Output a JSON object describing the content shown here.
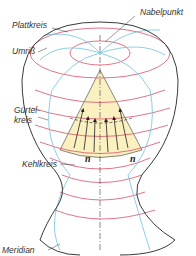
{
  "labels": {
    "plattkreis": "Plattkreis",
    "nabelpunkt": "Nabelpunkt",
    "umriss": "Umriß",
    "guertelkreis_line1": "Gürtel-",
    "guertelkreis_line2": "kreis",
    "kehlkreis": "Kehlkreis",
    "meridian": "Meridian",
    "normal_left": "n",
    "normal_right": "n"
  },
  "colors": {
    "outline": "#3a3a3a",
    "parallel_circles": "#d9506a",
    "meridians": "#6fc3dc",
    "cone_fill": "#fbf0bf",
    "arrows": "#222222"
  }
}
